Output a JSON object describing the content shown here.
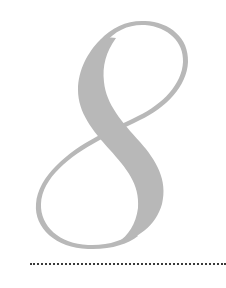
{
  "numeral": {
    "character": "8",
    "style": "decorative serif numeral",
    "fill_color": "#b8b8b8"
  },
  "rule": {
    "style": "dotted",
    "color": "#3a3a3a"
  }
}
